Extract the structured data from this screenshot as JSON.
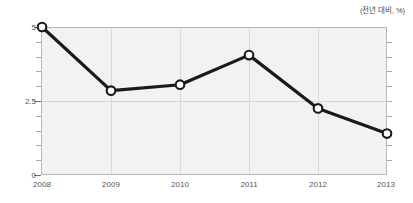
{
  "chart_data": {
    "type": "line",
    "title": "",
    "subtitle": "",
    "unit_note": "(전년 대비, %)",
    "xlabel": "",
    "ylabel": "",
    "categories": [
      "2008",
      "2009",
      "2010",
      "2011",
      "2012",
      "2013"
    ],
    "values": [
      5.0,
      2.85,
      3.05,
      4.05,
      2.25,
      1.4
    ],
    "series": [
      {
        "name": "",
        "values": [
          5.0,
          2.85,
          3.05,
          4.05,
          2.25,
          1.4
        ]
      }
    ],
    "ylim": [
      0,
      5
    ],
    "ytick_labels": [
      "0",
      "2.5",
      "5"
    ],
    "ytick_values": [
      0,
      2.5,
      5
    ],
    "yminor_step": 0.5,
    "xtick_labels": [
      "2008",
      "2009",
      "2010",
      "2011",
      "2012",
      "2013"
    ],
    "grid": true,
    "legend": false,
    "legend_position": "none",
    "marker": "open-circle",
    "colors": {
      "line": "#1a1a1a",
      "marker_fill": "#ffffff",
      "marker_stroke": "#1a1a1a",
      "plot_background": "#f2f2f2",
      "gridline": "#d4d4d4",
      "axis_border": "#b9b9b9",
      "text": "#555555"
    }
  },
  "axis": {
    "y_labels": [
      {
        "text": "5",
        "value": 5
      },
      {
        "text": "2.5",
        "value": 2.5
      },
      {
        "text": "0",
        "value": 0
      }
    ],
    "x_labels": [
      {
        "text": "2008"
      },
      {
        "text": "2009"
      },
      {
        "text": "2010"
      },
      {
        "text": "2011"
      },
      {
        "text": "2012"
      },
      {
        "text": "2013"
      }
    ]
  },
  "caption": {
    "unit": "(전년 대비, %)"
  }
}
